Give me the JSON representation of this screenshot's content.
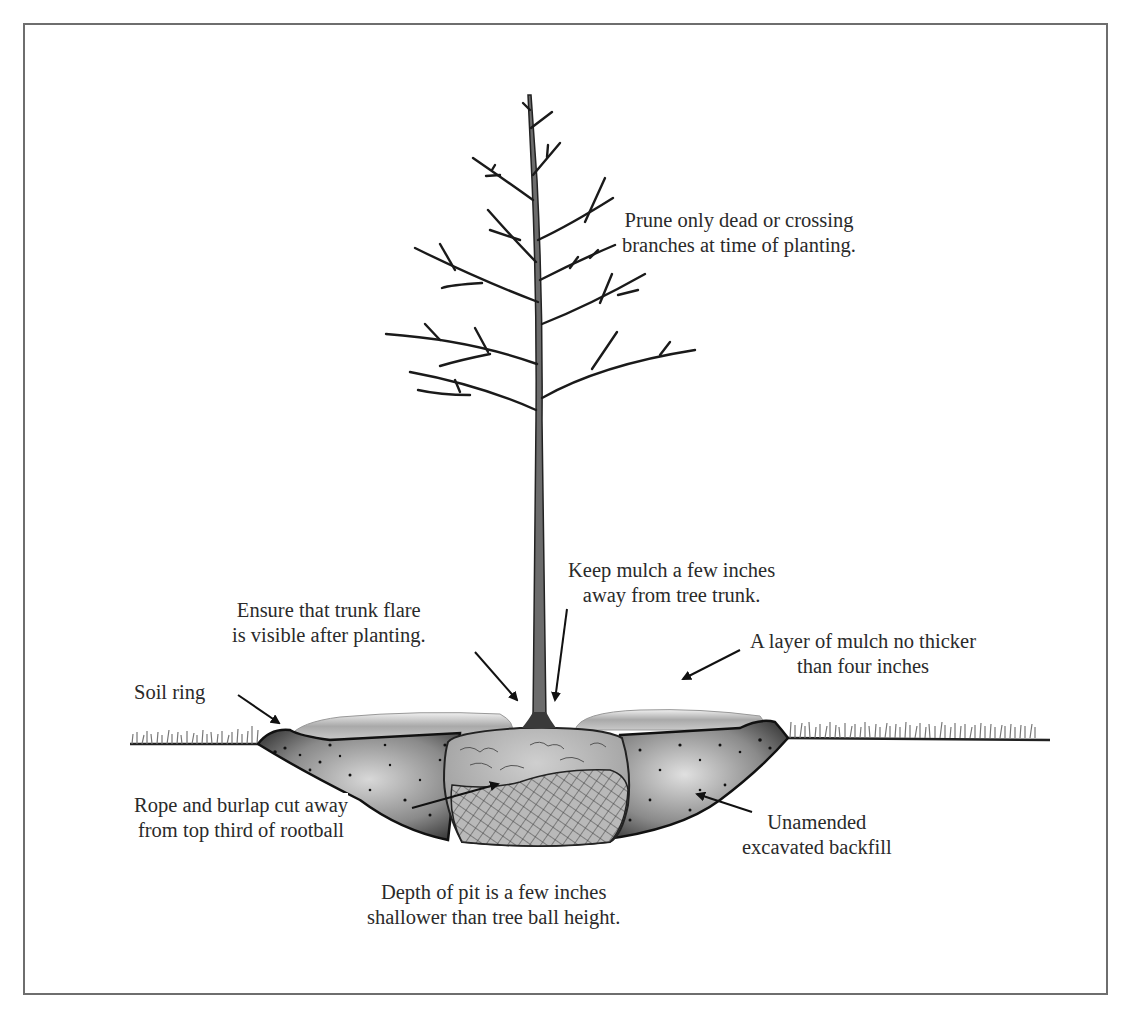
{
  "diagram": {
    "type": "tree-planting-cross-section",
    "labels": {
      "prune": {
        "line1": "Prune only dead or crossing",
        "line2": "branches at time of planting."
      },
      "mulch_distance": {
        "line1": "Keep mulch a few inches",
        "line2": "away from tree trunk."
      },
      "trunk_flare": {
        "line1": "Ensure that trunk flare",
        "line2": "is visible after planting."
      },
      "mulch_layer": {
        "line1": "A layer of mulch no thicker",
        "line2": "than four inches"
      },
      "soil_ring": {
        "line1": "Soil ring"
      },
      "burlap": {
        "line1": "Rope and burlap cut away",
        "line2": "from top third of rootball"
      },
      "backfill": {
        "line1": "Unamended",
        "line2": "excavated backfill"
      },
      "pit_depth": {
        "line1": "Depth of pit is a few inches",
        "line2": "shallower than tree ball height."
      }
    },
    "colors": {
      "frame": "#6e6e6e",
      "ink": "#222222",
      "soil": "#6a6a6a",
      "mulch": "#b5b5b5",
      "rootball": "#a8a8a8",
      "text": "#2a2a2a"
    }
  }
}
